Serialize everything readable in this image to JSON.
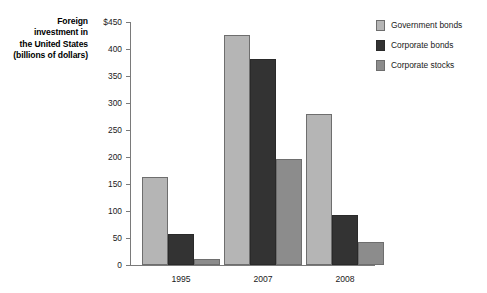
{
  "chart_data": {
    "type": "bar",
    "title": "",
    "axis_title_lines": [
      "Foreign",
      "investment in",
      "the United States",
      "(billions of dollars)"
    ],
    "xlabel": "",
    "ylabel": "Foreign investment in the United States (billions of dollars)",
    "categories": [
      "1995",
      "2007",
      "2008"
    ],
    "series": [
      {
        "name": "Government bonds",
        "color": "#b5b5b5",
        "values": [
          163,
          426,
          280
        ]
      },
      {
        "name": "Corporate bonds",
        "color": "#333333",
        "values": [
          58,
          382,
          93
        ]
      },
      {
        "name": "Corporate stocks",
        "color": "#8c8c8c",
        "values": [
          11,
          196,
          43
        ]
      }
    ],
    "ylim": [
      0,
      450
    ],
    "ytick_values": [
      0,
      50,
      100,
      150,
      200,
      250,
      300,
      350,
      400,
      450
    ],
    "ytick_labels": [
      "0",
      "50",
      "100",
      "150",
      "200",
      "250",
      "300",
      "350",
      "400",
      "$450"
    ],
    "grid": false,
    "legend_position": "right"
  },
  "legend": {
    "items": [
      {
        "label": "Government bonds",
        "swatch_name": "legend-swatch-government-bonds"
      },
      {
        "label": "Corporate bonds",
        "swatch_name": "legend-swatch-corporate-bonds"
      },
      {
        "label": "Corporate stocks",
        "swatch_name": "legend-swatch-corporate-stocks"
      }
    ]
  }
}
